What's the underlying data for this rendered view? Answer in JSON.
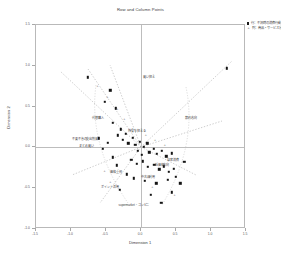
{
  "chart": {
    "title": "Row and Column Points",
    "xlabel": "Dimension 1",
    "ylabel": "Dimension 2"
  },
  "legend": {
    "entries": [
      {
        "marker": "square",
        "label": "行：不況時の消費行動"
      },
      {
        "marker": "plus",
        "label": "列：商品・サービス分野"
      }
    ]
  },
  "chart_data": {
    "type": "scatter",
    "title": "Row and Column Points",
    "xlabel": "Dimension 1",
    "ylabel": "Dimension 2",
    "xlim": [
      -1.5,
      1.5
    ],
    "ylim": [
      -1.0,
      1.5
    ],
    "grid": false,
    "legend_position": "top-right",
    "xticks": [
      -1.5,
      -1.0,
      -0.5,
      0.0,
      0.5,
      1.0,
      1.5
    ],
    "xticklabels": [
      "-1.5",
      "-1.0",
      "-0.5",
      "0.0",
      "0.5",
      "1.0",
      "1.5"
    ],
    "yticks": [
      -1.0,
      -0.5,
      0.0,
      0.5,
      1.0,
      1.5
    ],
    "yticklabels": [
      "-1.0",
      "-0.5",
      "0.0",
      "0.5",
      "1.0",
      "1.5"
    ],
    "series": [
      {
        "name": "行：不況時の消費行動",
        "marker": "square",
        "points": [
          {
            "x": 1.23,
            "y": 0.97,
            "label": ""
          },
          {
            "x": -0.76,
            "y": 0.86,
            "label": ""
          },
          {
            "x": -0.44,
            "y": 0.7,
            "label": ""
          },
          {
            "x": -0.52,
            "y": 0.56,
            "label": ""
          },
          {
            "x": -0.36,
            "y": 0.48,
            "label": ""
          },
          {
            "x": -0.4,
            "y": 0.3,
            "label": ""
          },
          {
            "x": -0.29,
            "y": 0.22,
            "label": ""
          },
          {
            "x": -0.33,
            "y": 0.15,
            "label": ""
          },
          {
            "x": -0.22,
            "y": 0.17,
            "label": ""
          },
          {
            "x": -0.26,
            "y": 0.09,
            "label": ""
          },
          {
            "x": -0.18,
            "y": 0.05,
            "label": ""
          },
          {
            "x": -0.12,
            "y": 0.12,
            "label": ""
          },
          {
            "x": -0.08,
            "y": 0.03,
            "label": ""
          },
          {
            "x": -0.02,
            "y": 0.07,
            "label": ""
          },
          {
            "x": 0.04,
            "y": 0.01,
            "label": ""
          },
          {
            "x": 0.09,
            "y": 0.05,
            "label": ""
          },
          {
            "x": -0.05,
            "y": -0.04,
            "label": ""
          },
          {
            "x": 0.01,
            "y": -0.09,
            "label": ""
          },
          {
            "x": 0.12,
            "y": -0.06,
            "label": ""
          },
          {
            "x": 0.18,
            "y": -0.02,
            "label": ""
          },
          {
            "x": 0.23,
            "y": -0.08,
            "label": ""
          },
          {
            "x": 0.3,
            "y": -0.04,
            "label": ""
          },
          {
            "x": 0.36,
            "y": -0.11,
            "label": ""
          },
          {
            "x": 0.44,
            "y": -0.07,
            "label": ""
          },
          {
            "x": -0.14,
            "y": -0.15,
            "label": ""
          },
          {
            "x": -0.06,
            "y": -0.2,
            "label": ""
          },
          {
            "x": 0.03,
            "y": -0.17,
            "label": ""
          },
          {
            "x": 0.1,
            "y": -0.24,
            "label": ""
          },
          {
            "x": 0.19,
            "y": -0.21,
            "label": ""
          },
          {
            "x": 0.26,
            "y": -0.27,
            "label": ""
          },
          {
            "x": 0.33,
            "y": -0.23,
            "label": ""
          },
          {
            "x": 0.4,
            "y": -0.3,
            "label": ""
          },
          {
            "x": 0.47,
            "y": -0.26,
            "label": ""
          },
          {
            "x": -0.2,
            "y": -0.33,
            "label": ""
          },
          {
            "x": -0.1,
            "y": -0.38,
            "label": ""
          },
          {
            "x": 0.05,
            "y": -0.41,
            "label": ""
          },
          {
            "x": 0.22,
            "y": -0.44,
            "label": ""
          },
          {
            "x": 0.38,
            "y": -0.4,
            "label": ""
          },
          {
            "x": 0.5,
            "y": -0.36,
            "label": ""
          },
          {
            "x": 0.56,
            "y": -0.44,
            "label": ""
          },
          {
            "x": -0.3,
            "y": -0.52,
            "label": ""
          },
          {
            "x": 0.14,
            "y": -0.58,
            "label": ""
          },
          {
            "x": 0.44,
            "y": -0.55,
            "label": ""
          },
          {
            "x": 0.29,
            "y": -0.68,
            "label": ""
          },
          {
            "x": -0.47,
            "y": 0.06,
            "label": ""
          },
          {
            "x": -0.55,
            "y": -0.02,
            "label": ""
          },
          {
            "x": -0.6,
            "y": 0.11,
            "label": ""
          },
          {
            "x": -0.4,
            "y": -0.12,
            "label": ""
          },
          {
            "x": -0.35,
            "y": -0.22,
            "label": ""
          },
          {
            "x": 0.62,
            "y": -0.18,
            "label": ""
          }
        ]
      },
      {
        "name": "列：商品・サービス分野",
        "marker": "plus",
        "points": [
          {
            "x": -0.62,
            "y": 0.74,
            "label": ""
          },
          {
            "x": -0.48,
            "y": 0.6,
            "label": ""
          },
          {
            "x": -0.34,
            "y": 0.46,
            "label": ""
          },
          {
            "x": -0.24,
            "y": 0.34,
            "label": ""
          },
          {
            "x": -0.15,
            "y": 0.2,
            "label": ""
          },
          {
            "x": 0.07,
            "y": 0.14,
            "label": ""
          },
          {
            "x": 0.2,
            "y": 0.08,
            "label": ""
          },
          {
            "x": 0.34,
            "y": 0.02,
            "label": ""
          },
          {
            "x": -0.52,
            "y": -0.3,
            "label": ""
          },
          {
            "x": -0.44,
            "y": -0.44,
            "label": ""
          },
          {
            "x": 0.48,
            "y": -0.6,
            "label": ""
          },
          {
            "x": 0.16,
            "y": -0.5,
            "label": ""
          }
        ]
      }
    ],
    "annotations": [
      {
        "x": 0.12,
        "y": 0.86,
        "text": "買い控え"
      },
      {
        "x": 0.72,
        "y": 0.36,
        "text": "節約志向"
      },
      {
        "x": -0.62,
        "y": 0.36,
        "text": "代替購入"
      },
      {
        "x": -0.8,
        "y": 0.1,
        "text": "不要不急の支出削減"
      },
      {
        "x": -0.78,
        "y": 0.02,
        "text": "まとめ買い"
      },
      {
        "x": -0.36,
        "y": -0.3,
        "text": "価格重視"
      },
      {
        "x": 0.1,
        "y": -0.36,
        "text": "中古品利用"
      },
      {
        "x": -0.44,
        "y": -0.48,
        "text": "ポイント活用"
      },
      {
        "x": 0.3,
        "y": -0.22,
        "text": "低価格志向"
      },
      {
        "x": -0.1,
        "y": -0.7,
        "text": "supermarket・コンビニ"
      },
      {
        "x": 0.46,
        "y": -0.16,
        "text": "自家消費"
      },
      {
        "x": -0.06,
        "y": 0.2,
        "text": "外食を控える"
      }
    ]
  }
}
